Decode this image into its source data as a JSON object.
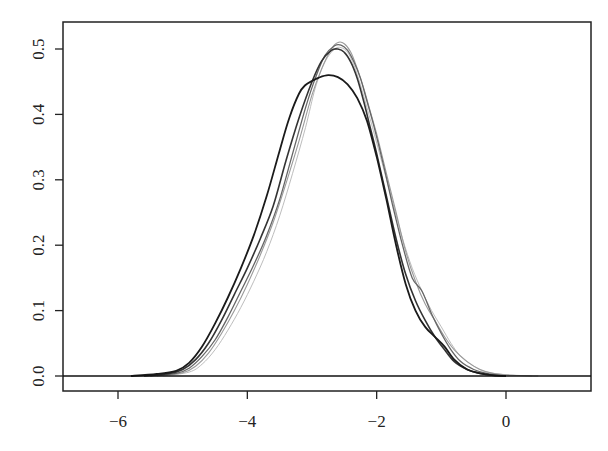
{
  "chart_data": {
    "type": "line",
    "title": "",
    "xlabel": "",
    "ylabel": "",
    "xlim": [
      -6.85,
      1.3
    ],
    "ylim": [
      -0.022,
      0.542
    ],
    "x_ticks": [
      -6,
      -4,
      -2,
      0
    ],
    "x_tick_labels": [
      "−6",
      "−4",
      "−2",
      "0"
    ],
    "y_ticks": [
      0.0,
      0.1,
      0.2,
      0.3,
      0.4,
      0.5
    ],
    "y_tick_labels": [
      "0.0",
      "0.1",
      "0.2",
      "0.3",
      "0.4",
      "0.5"
    ],
    "grid": false,
    "legend": null,
    "hline": {
      "y": 0,
      "color": "#111111"
    },
    "series": [
      {
        "name": "density-1 (dark, lower peak)",
        "color": "#1a1a1a",
        "width": 1.8,
        "x": [
          -5.8,
          -5.4,
          -5.1,
          -4.9,
          -4.7,
          -4.5,
          -4.3,
          -4.1,
          -3.9,
          -3.7,
          -3.5,
          -3.35,
          -3.2,
          -3.1,
          -3.0,
          -2.9,
          -2.75,
          -2.6,
          -2.45,
          -2.3,
          -2.15,
          -2.0,
          -1.85,
          -1.7,
          -1.55,
          -1.4,
          -1.25,
          -1.1,
          -0.95,
          -0.8,
          -0.6,
          -0.4,
          -0.2,
          0.0
        ],
        "y": [
          0.0,
          0.003,
          0.008,
          0.02,
          0.045,
          0.08,
          0.12,
          0.165,
          0.215,
          0.275,
          0.345,
          0.395,
          0.432,
          0.445,
          0.451,
          0.456,
          0.46,
          0.457,
          0.446,
          0.425,
          0.39,
          0.335,
          0.27,
          0.2,
          0.14,
          0.1,
          0.075,
          0.06,
          0.045,
          0.025,
          0.01,
          0.004,
          0.001,
          0.0
        ]
      },
      {
        "name": "density-2 (dark gray, high peak)",
        "color": "#333333",
        "width": 1.6,
        "x": [
          -5.6,
          -5.2,
          -5.0,
          -4.8,
          -4.6,
          -4.4,
          -4.2,
          -4.0,
          -3.8,
          -3.6,
          -3.4,
          -3.2,
          -3.0,
          -2.85,
          -2.7,
          -2.6,
          -2.5,
          -2.4,
          -2.3,
          -2.2,
          -2.1,
          -2.0,
          -1.85,
          -1.7,
          -1.55,
          -1.4,
          -1.25,
          -1.1,
          -0.95,
          -0.8,
          -0.6,
          -0.4,
          -0.2,
          0.0
        ],
        "y": [
          0.0,
          0.004,
          0.01,
          0.025,
          0.05,
          0.085,
          0.125,
          0.165,
          0.21,
          0.26,
          0.33,
          0.395,
          0.45,
          0.482,
          0.498,
          0.5,
          0.495,
          0.48,
          0.455,
          0.42,
          0.38,
          0.34,
          0.275,
          0.21,
          0.155,
          0.115,
          0.085,
          0.06,
          0.04,
          0.022,
          0.01,
          0.004,
          0.001,
          0.0
        ]
      },
      {
        "name": "density-3 (gray)",
        "color": "#666666",
        "width": 1.3,
        "x": [
          -5.5,
          -5.1,
          -4.9,
          -4.7,
          -4.5,
          -4.3,
          -4.1,
          -3.9,
          -3.7,
          -3.5,
          -3.3,
          -3.1,
          -2.95,
          -2.8,
          -2.65,
          -2.55,
          -2.45,
          -2.35,
          -2.25,
          -2.15,
          -2.05,
          -1.9,
          -1.75,
          -1.6,
          -1.45,
          -1.3,
          -1.15,
          -1.0,
          -0.85,
          -0.7,
          -0.5,
          -0.3,
          0.0
        ],
        "y": [
          0.0,
          0.004,
          0.012,
          0.03,
          0.055,
          0.09,
          0.13,
          0.17,
          0.215,
          0.27,
          0.34,
          0.41,
          0.455,
          0.49,
          0.505,
          0.506,
          0.498,
          0.48,
          0.455,
          0.42,
          0.385,
          0.325,
          0.26,
          0.2,
          0.15,
          0.13,
          0.095,
          0.065,
          0.04,
          0.022,
          0.01,
          0.004,
          0.0
        ]
      },
      {
        "name": "density-4 (light gray)",
        "color": "#9a9a9a",
        "width": 1.1,
        "x": [
          -5.4,
          -5.0,
          -4.8,
          -4.6,
          -4.4,
          -4.2,
          -4.0,
          -3.8,
          -3.6,
          -3.4,
          -3.2,
          -3.0,
          -2.85,
          -2.7,
          -2.6,
          -2.5,
          -2.4,
          -2.3,
          -2.2,
          -2.1,
          -2.0,
          -1.85,
          -1.7,
          -1.55,
          -1.4,
          -1.25,
          -1.1,
          -0.95,
          -0.8,
          -0.6,
          -0.4,
          -0.2,
          0.1,
          0.5
        ],
        "y": [
          0.0,
          0.005,
          0.015,
          0.035,
          0.065,
          0.1,
          0.14,
          0.185,
          0.235,
          0.295,
          0.36,
          0.43,
          0.47,
          0.5,
          0.51,
          0.508,
          0.495,
          0.47,
          0.44,
          0.405,
          0.37,
          0.31,
          0.25,
          0.19,
          0.145,
          0.11,
          0.085,
          0.06,
          0.04,
          0.022,
          0.01,
          0.004,
          0.001,
          0.0
        ]
      },
      {
        "name": "density-5 (faint)",
        "color": "#bdbdbd",
        "width": 1.0,
        "x": [
          -5.3,
          -4.9,
          -4.7,
          -4.5,
          -4.3,
          -4.1,
          -3.9,
          -3.7,
          -3.5,
          -3.3,
          -3.1,
          -2.95,
          -2.8,
          -2.65,
          -2.55,
          -2.45,
          -2.35,
          -2.25,
          -2.15,
          -2.05,
          -1.9,
          -1.75,
          -1.6,
          -1.45,
          -1.3,
          -1.15,
          -1.0,
          -0.85,
          -0.7,
          -0.5,
          -0.3,
          0.0,
          0.4
        ],
        "y": [
          0.0,
          0.006,
          0.018,
          0.04,
          0.07,
          0.105,
          0.145,
          0.19,
          0.245,
          0.31,
          0.38,
          0.44,
          0.48,
          0.5,
          0.502,
          0.495,
          0.475,
          0.445,
          0.41,
          0.375,
          0.32,
          0.265,
          0.21,
          0.165,
          0.13,
          0.1,
          0.075,
          0.05,
          0.03,
          0.015,
          0.006,
          0.002,
          0.0
        ]
      }
    ]
  },
  "plot_area": {
    "left": 63,
    "top": 22,
    "right": 591,
    "bottom": 391,
    "x_px_at_neg6": 118,
    "x_px_at_0": 506,
    "y_px_at_0": 376,
    "y_px_at_05": 49
  }
}
